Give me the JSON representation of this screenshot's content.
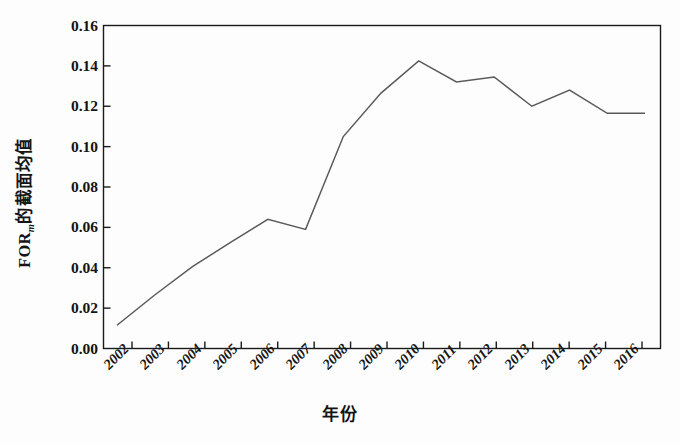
{
  "chart_data": {
    "type": "line",
    "title": "",
    "xlabel": "年份",
    "ylabel": "FOR_m的截面均值",
    "ylabel_main": "FOR",
    "ylabel_sub": "m",
    "ylabel_tail": "的截面均值",
    "categories": [
      "2002",
      "2003",
      "2004",
      "2005",
      "2006",
      "2007",
      "2008",
      "2009",
      "2010",
      "2011",
      "2012",
      "2013",
      "2014",
      "2015",
      "2016"
    ],
    "x": [
      2002,
      2003,
      2004,
      2005,
      2006,
      2007,
      2008,
      2009,
      2010,
      2011,
      2012,
      2013,
      2014,
      2015,
      2016
    ],
    "values": [
      0.0115,
      0.0265,
      0.0405,
      0.0525,
      0.064,
      0.059,
      0.105,
      0.1265,
      0.1425,
      0.132,
      0.1345,
      0.12,
      0.128,
      0.1165,
      0.1165
    ],
    "ylim": [
      0.0,
      0.16
    ],
    "ytick_values": [
      "0.16",
      "0.14",
      "0.12",
      "0.10",
      "0.08",
      "0.06",
      "0.04",
      "0.02",
      "0.00"
    ],
    "ytick_numbers": [
      0.16,
      0.14,
      0.12,
      0.1,
      0.08,
      0.06,
      0.04,
      0.02,
      0.0
    ],
    "grid": false,
    "legend": false,
    "legend_position": "none",
    "line_color": "#5a5a5a",
    "axis_color": "#1a1a1a",
    "background_color": "#fdfdfd"
  }
}
